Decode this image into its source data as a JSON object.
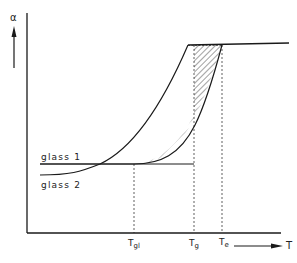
{
  "diagram": {
    "y_axis_label": "α",
    "x_axis_label": "T",
    "curve_labels": {
      "glass1": "glass 1",
      "glass2": "glass 2"
    },
    "tick_labels": {
      "tgl_main": "T",
      "tgl_sub": "gl",
      "tg_main": "T",
      "tg_sub": "g",
      "te_main": "T",
      "te_sub": "e"
    },
    "colors": {
      "line": "#1a1a1a",
      "hatch": "#555555",
      "background": "#ffffff"
    }
  }
}
